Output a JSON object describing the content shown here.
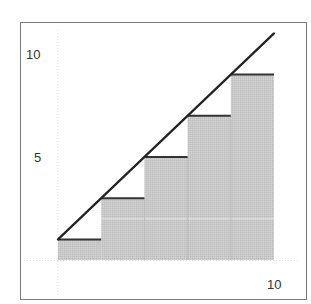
{
  "chart_data": {
    "type": "bar",
    "title": "",
    "xlabel": "",
    "ylabel": "",
    "xlim": [
      0,
      10
    ],
    "ylim": [
      0,
      10
    ],
    "x_ticks": [
      {
        "value": 10,
        "label": "10"
      }
    ],
    "y_ticks": [
      {
        "value": 5,
        "label": "5"
      },
      {
        "value": 10,
        "label": "10"
      }
    ],
    "grid": true,
    "bars": [
      {
        "x_start": 0,
        "x_end": 2,
        "height": 1
      },
      {
        "x_start": 2,
        "x_end": 4,
        "height": 3
      },
      {
        "x_start": 4,
        "x_end": 6,
        "height": 5
      },
      {
        "x_start": 6,
        "x_end": 8,
        "height": 7
      },
      {
        "x_start": 8,
        "x_end": 10,
        "height": 9
      }
    ],
    "line": {
      "name": "y = x + 1",
      "points": [
        [
          0,
          1
        ],
        [
          10,
          11
        ]
      ]
    },
    "colors": {
      "bar_fill": "#c4c4c4",
      "step_edge": "#333333",
      "line": "#222222",
      "frame": "#777777",
      "grid": "#dddddd"
    }
  }
}
